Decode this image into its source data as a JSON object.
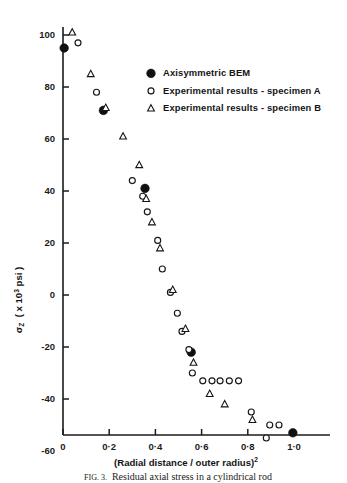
{
  "figure": {
    "caption_prefix": "FIG. 3.",
    "caption_text": "Residual axial stress in a cylindrical rod"
  },
  "legend": {
    "items": [
      {
        "marker": "filled-circle-marker",
        "label": "Axisymmetric BEM"
      },
      {
        "marker": "open-circle-marker",
        "label": "Experimental results - specimen A"
      },
      {
        "marker": "open-triangle-marker",
        "label": "Experimental results - specimen B"
      }
    ]
  },
  "axes": {
    "y_title_symbol": "σ",
    "y_title_sub": "Z",
    "y_title_rest_open": "( x 10",
    "y_title_exp": "3",
    "y_title_rest_close": " psi )",
    "x_title_open": "(Radial distance / outer radius)",
    "x_title_exp": "2",
    "x_ticklabels": [
      "0",
      "0·2",
      "0·4",
      "0·6",
      "0·8",
      "1·0"
    ],
    "y_ticklabels": [
      "100",
      "80",
      "60",
      "40",
      "20",
      "0",
      "-20",
      "-40",
      "-60"
    ]
  },
  "chart_data": {
    "type": "scatter",
    "title": "Residual axial stress in a cylindrical rod",
    "xlabel": "(Radial distance / outer radius)^2",
    "ylabel": "sigma_Z ( x 10^3 psi )",
    "xlim": [
      0.0,
      1.1
    ],
    "ylim": [
      -60,
      108
    ],
    "xticks": [
      0.0,
      0.2,
      0.4,
      0.6,
      0.8,
      1.0
    ],
    "yticks": [
      100,
      80,
      60,
      40,
      20,
      0,
      -20,
      -40,
      -60
    ],
    "grid": false,
    "legend_position": "upper-right-inside",
    "series": [
      {
        "name": "Axisymmetric BEM",
        "marker": "filled-circle",
        "points": [
          [
            0.005,
            95
          ],
          [
            0.175,
            71
          ],
          [
            0.355,
            41
          ],
          [
            0.555,
            -22
          ],
          [
            0.995,
            -53
          ]
        ]
      },
      {
        "name": "Experimental results - specimen A",
        "marker": "open-circle",
        "points": [
          [
            0.065,
            97
          ],
          [
            0.145,
            78
          ],
          [
            0.3,
            44
          ],
          [
            0.345,
            38
          ],
          [
            0.365,
            32
          ],
          [
            0.41,
            21
          ],
          [
            0.43,
            10
          ],
          [
            0.465,
            1
          ],
          [
            0.495,
            -7
          ],
          [
            0.515,
            -14
          ],
          [
            0.545,
            -21
          ],
          [
            0.56,
            -30
          ],
          [
            0.605,
            -33
          ],
          [
            0.645,
            -33
          ],
          [
            0.68,
            -33
          ],
          [
            0.72,
            -33
          ],
          [
            0.76,
            -33
          ],
          [
            0.815,
            -45
          ],
          [
            0.88,
            -55
          ],
          [
            0.895,
            -50
          ],
          [
            0.935,
            -50
          ]
        ]
      },
      {
        "name": "Experimental results - specimen B",
        "marker": "open-triangle",
        "points": [
          [
            0.04,
            101
          ],
          [
            0.12,
            85
          ],
          [
            0.185,
            72
          ],
          [
            0.26,
            61
          ],
          [
            0.33,
            50
          ],
          [
            0.36,
            37
          ],
          [
            0.385,
            28
          ],
          [
            0.42,
            18
          ],
          [
            0.475,
            2
          ],
          [
            0.53,
            -13
          ],
          [
            0.565,
            -26
          ],
          [
            0.635,
            -38
          ],
          [
            0.7,
            -42
          ],
          [
            0.82,
            -48
          ]
        ]
      }
    ]
  }
}
